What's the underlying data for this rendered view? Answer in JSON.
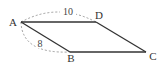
{
  "figure": {
    "shape": "parallelogram",
    "vertices": {
      "A": "A",
      "B": "B",
      "C": "C",
      "D": "D"
    },
    "edges": [
      "AD",
      "DC",
      "CB",
      "BA"
    ],
    "measurements": {
      "AD": "10",
      "AB": "8"
    },
    "colors": {
      "edge": "#333333",
      "dimension_arc": "#888888"
    }
  }
}
